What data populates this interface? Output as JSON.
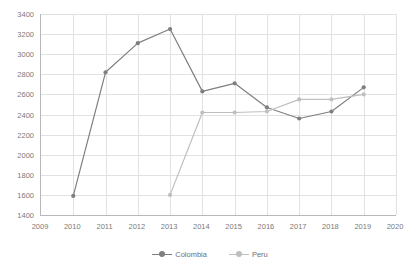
{
  "chart_data": {
    "type": "line",
    "title": "",
    "subtitle": "",
    "xlabel": "",
    "ylabel": "",
    "xlim": [
      2009,
      2020
    ],
    "ylim": [
      1400,
      3400
    ],
    "ytick_step": 200,
    "grid": true,
    "legend_position": "bottom",
    "x_ticks": [
      "2009",
      "2010",
      "2011",
      "2012",
      "2013",
      "2014",
      "2015",
      "2016",
      "2017",
      "2018",
      "2019",
      "2020"
    ],
    "y_ticks": [
      "1400",
      "1600",
      "1800",
      "2000",
      "2200",
      "2400",
      "2600",
      "2800",
      "3000",
      "3200",
      "3400"
    ],
    "series": [
      {
        "name": "Colombia",
        "color": "#7f7f7f",
        "marker": "circle",
        "x": [
          2010,
          2011,
          2012,
          2013,
          2014,
          2015,
          2016,
          2017,
          2018,
          2019
        ],
        "values": [
          1590,
          2820,
          3110,
          3250,
          2630,
          2710,
          2470,
          2360,
          2430,
          2670
        ]
      },
      {
        "name": "Peru",
        "color": "#bfbfbf",
        "marker": "circle",
        "x": [
          2013,
          2014,
          2015,
          2016,
          2017,
          2018,
          2019
        ],
        "values": [
          1600,
          2420,
          2420,
          2430,
          2550,
          2550,
          2600
        ]
      }
    ]
  },
  "legend": {
    "items": [
      {
        "label": "Colombia",
        "color": "#7f7f7f"
      },
      {
        "label": "Peru",
        "color": "#bfbfbf"
      }
    ]
  },
  "colors": {
    "colombia": "#7f7f7f",
    "peru": "#bfbfbf",
    "grid": "#e2e2e2",
    "axis": "#b8b8b8",
    "tick_text": "#7a7a7a",
    "background": "#ffffff"
  }
}
